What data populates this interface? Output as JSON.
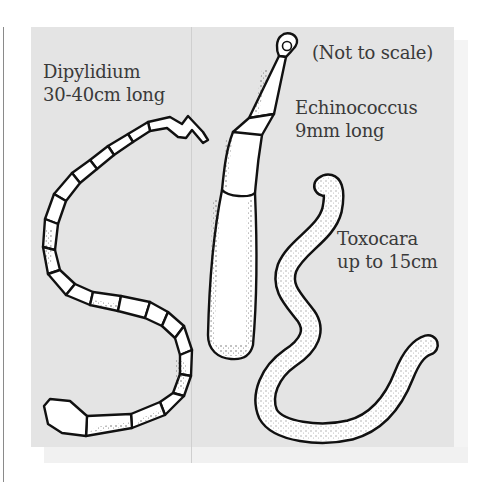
{
  "figure": {
    "note": "(Not to scale)",
    "worms": [
      {
        "id": "dipylidium",
        "name": "Dipylidium",
        "size": "30-40cm long"
      },
      {
        "id": "echinococcus",
        "name": "Echinococcus",
        "size": "9mm long"
      },
      {
        "id": "toxocara",
        "name": "Toxocara",
        "size": "up to 15cm"
      }
    ],
    "colors": {
      "background": "#e4e4e4",
      "outline": "#111111",
      "body_fill": "#ffffff",
      "text": "#3a3a3a"
    }
  }
}
